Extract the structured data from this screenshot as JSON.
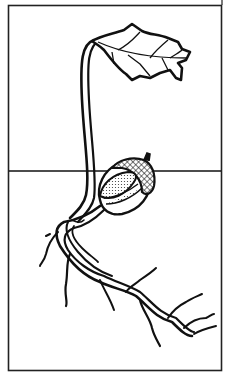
{
  "illustration": {
    "subject": "germinating acorn seedling",
    "parts": [
      "leaf",
      "stem",
      "acorn",
      "soil-line",
      "roots"
    ],
    "colors": {
      "background": "#ffffff",
      "ink": "#111111"
    }
  }
}
